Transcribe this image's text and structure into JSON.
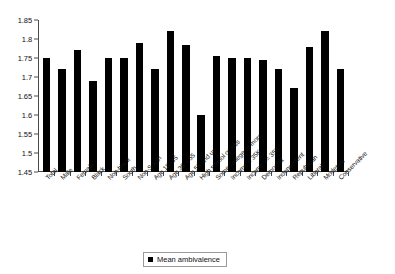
{
  "chart_data": {
    "type": "bar",
    "title": "",
    "xlabel": "",
    "ylabel": "",
    "ylim": [
      1.45,
      1.85
    ],
    "ytick_step": 0.05,
    "ytick_labels": [
      "1.85",
      "1.8",
      "1.75",
      "1.7",
      "1.65",
      "1.6",
      "1.55",
      "1.5",
      "1.45"
    ],
    "ytick_values": [
      1.85,
      1.8,
      1.75,
      1.7,
      1.65,
      1.6,
      1.55,
      1.5,
      1.45
    ],
    "grid": false,
    "legend_position": "bottom-center",
    "series_name": "Mean ambivalence",
    "bar_color": "#000000",
    "categories": [
      "Total",
      "Male",
      "Female",
      "Black",
      "Non-black",
      "South",
      "Non-South",
      "Age 18–35",
      "Age 36 – 55",
      "Age 56 and up",
      "High school or less",
      "Some college or more",
      "Income < 35K",
      "Income >= 35K",
      "Democrat",
      "Independent",
      "Republican",
      "Liberal",
      "Moderate",
      "Conservative"
    ],
    "values": [
      1.75,
      1.72,
      1.77,
      1.69,
      1.75,
      1.75,
      1.79,
      1.72,
      1.82,
      1.785,
      1.6,
      1.755,
      1.75,
      1.75,
      1.745,
      1.72,
      1.67,
      1.78,
      1.82,
      1.72
    ]
  },
  "legend": {
    "label": "Mean ambivalence",
    "swatch_color": "#000000"
  }
}
